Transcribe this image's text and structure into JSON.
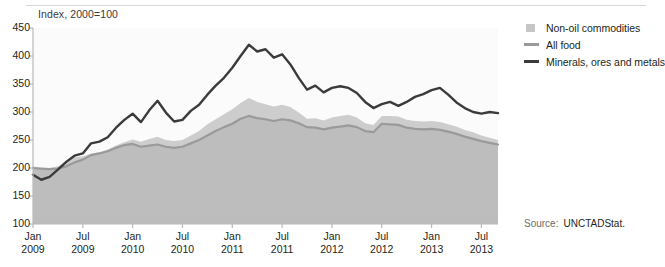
{
  "axis_note": "Index, 2000=100",
  "source": {
    "label": "Source:",
    "value": "UNCTADStat."
  },
  "legend": {
    "position": "right",
    "items": [
      {
        "label": "Non-oil commodities",
        "key": "area-swatch",
        "color": "#c6c6c6"
      },
      {
        "label": "All food",
        "key": "line-swatch",
        "color": "#9a9a9a"
      },
      {
        "label": "Minerals, ores and metals",
        "key": "line-swatch",
        "color": "#3b3b3b"
      }
    ]
  },
  "yaxis": {
    "ticks": [
      "450",
      "400",
      "350",
      "300",
      "250",
      "200",
      "150",
      "100"
    ],
    "min": 100,
    "max": 450,
    "step": 50
  },
  "xaxis": {
    "ticks": [
      {
        "month": "Jan",
        "year": "2009"
      },
      {
        "month": "Jul",
        "year": "2009"
      },
      {
        "month": "Jan",
        "year": "2010"
      },
      {
        "month": "Jul",
        "year": "2010"
      },
      {
        "month": "Jan",
        "year": "2011"
      },
      {
        "month": "Jul",
        "year": "2011"
      },
      {
        "month": "Jan",
        "year": "2012"
      },
      {
        "month": "Jul",
        "year": "2012"
      },
      {
        "month": "Jan",
        "year": "2013"
      },
      {
        "month": "Jul",
        "year": "2013"
      }
    ]
  },
  "chart_data": {
    "type": "area",
    "title": "",
    "subtitle": "",
    "xlabel": "",
    "ylabel": "Index, 2000=100",
    "ylim": [
      100,
      450
    ],
    "ystep": 50,
    "grid": false,
    "legend_position": "right",
    "x": [
      "2009-01",
      "2009-02",
      "2009-03",
      "2009-04",
      "2009-05",
      "2009-06",
      "2009-07",
      "2009-08",
      "2009-09",
      "2009-10",
      "2009-11",
      "2009-12",
      "2010-01",
      "2010-02",
      "2010-03",
      "2010-04",
      "2010-05",
      "2010-06",
      "2010-07",
      "2010-08",
      "2010-09",
      "2010-10",
      "2010-11",
      "2010-12",
      "2011-01",
      "2011-02",
      "2011-03",
      "2011-04",
      "2011-05",
      "2011-06",
      "2011-07",
      "2011-08",
      "2011-09",
      "2011-10",
      "2011-11",
      "2011-12",
      "2012-01",
      "2012-02",
      "2012-03",
      "2012-04",
      "2012-05",
      "2012-06",
      "2012-07",
      "2012-08",
      "2012-09",
      "2012-10",
      "2012-11",
      "2012-12",
      "2013-01",
      "2013-02",
      "2013-03",
      "2013-04",
      "2013-05",
      "2013-06",
      "2013-07",
      "2013-08",
      "2013-09"
    ],
    "x_tick_labels": [
      "Jan 2009",
      "Jul 2009",
      "Jan 2010",
      "Jul 2010",
      "Jan 2011",
      "Jul 2011",
      "Jan 2012",
      "Jul 2012",
      "Jan 2013",
      "Jul 2013"
    ],
    "series": [
      {
        "name": "Non-oil commodities",
        "style": "area",
        "color": "#c6c6c6",
        "values": [
          203,
          199,
          200,
          203,
          211,
          219,
          221,
          226,
          228,
          233,
          240,
          246,
          251,
          247,
          252,
          256,
          250,
          248,
          250,
          258,
          266,
          278,
          287,
          296,
          305,
          316,
          325,
          318,
          314,
          310,
          313,
          309,
          299,
          288,
          289,
          285,
          290,
          293,
          295,
          290,
          280,
          277,
          293,
          293,
          292,
          286,
          284,
          283,
          284,
          282,
          278,
          274,
          268,
          264,
          258,
          254,
          250
        ]
      },
      {
        "name": "All food",
        "style": "line",
        "color": "#9a9a9a",
        "values": [
          200,
          199,
          198,
          199,
          203,
          210,
          215,
          223,
          226,
          230,
          236,
          241,
          243,
          238,
          240,
          242,
          238,
          236,
          238,
          244,
          250,
          258,
          266,
          273,
          279,
          288,
          293,
          289,
          287,
          284,
          287,
          285,
          280,
          273,
          272,
          269,
          272,
          274,
          276,
          273,
          266,
          264,
          279,
          278,
          277,
          272,
          270,
          269,
          270,
          268,
          265,
          261,
          256,
          252,
          248,
          245,
          242
        ]
      },
      {
        "name": "Minerals, ores and metals",
        "style": "line",
        "color": "#3b3b3b",
        "values": [
          188,
          179,
          184,
          197,
          211,
          222,
          226,
          244,
          247,
          255,
          272,
          286,
          297,
          282,
          303,
          320,
          299,
          283,
          286,
          302,
          313,
          331,
          347,
          361,
          379,
          400,
          420,
          408,
          412,
          397,
          403,
          385,
          361,
          340,
          347,
          335,
          343,
          346,
          343,
          334,
          318,
          307,
          314,
          318,
          311,
          318,
          327,
          332,
          339,
          343,
          331,
          317,
          307,
          300,
          297,
          300,
          298
        ]
      }
    ]
  }
}
